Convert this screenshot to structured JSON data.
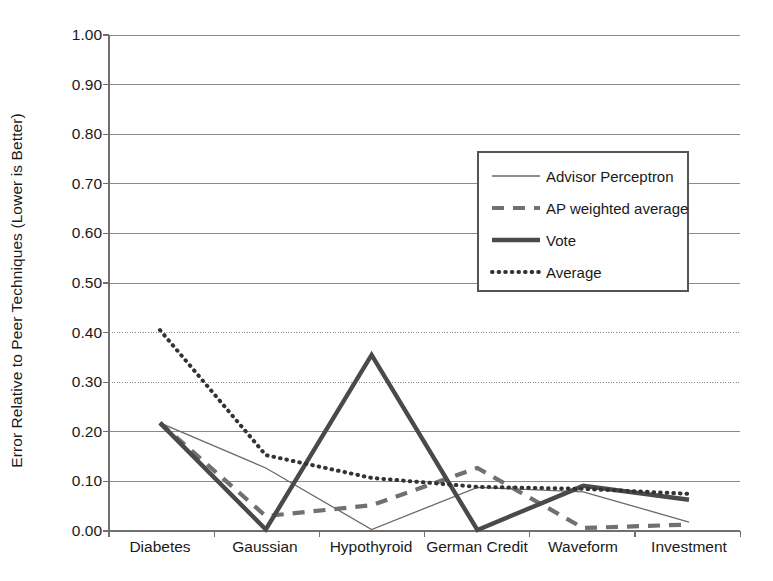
{
  "chart_data": {
    "type": "line",
    "title": "",
    "xlabel": "",
    "ylabel": "Error Relative to Peer Techniques (Lower is Better)",
    "categories": [
      "Diabetes",
      "Gaussian",
      "Hypothyroid",
      "German Credit",
      "Waveform",
      "Investment"
    ],
    "ylim": [
      0.0,
      1.0
    ],
    "ytick_labels": [
      "0.00",
      "0.10",
      "0.20",
      "0.30",
      "0.40",
      "0.50",
      "0.60",
      "0.70",
      "0.80",
      "0.90",
      "1.00"
    ],
    "ytick_values": [
      0.0,
      0.1,
      0.2,
      0.3,
      0.4,
      0.5,
      0.6,
      0.7,
      0.8,
      0.9,
      1.0
    ],
    "grid": true,
    "legend_position": "upper right",
    "series": [
      {
        "name": "Advisor Perceptron",
        "style": "thin-solid",
        "values": [
          0.218,
          0.127,
          0.003,
          0.088,
          0.079,
          0.018
        ]
      },
      {
        "name": "AP weighted average",
        "style": "thick-dashed",
        "values": [
          0.218,
          0.03,
          0.052,
          0.127,
          0.006,
          0.013
        ]
      },
      {
        "name": "Vote",
        "style": "thick-solid",
        "values": [
          0.218,
          0.003,
          0.355,
          0.002,
          0.091,
          0.063
        ]
      },
      {
        "name": "Average",
        "style": "dotted",
        "values": [
          0.405,
          0.153,
          0.107,
          0.089,
          0.085,
          0.075
        ]
      }
    ]
  },
  "legend": {
    "items": [
      {
        "label": "Advisor Perceptron"
      },
      {
        "label": "AP weighted average"
      },
      {
        "label": "Vote"
      },
      {
        "label": "Average"
      }
    ]
  },
  "colors": {
    "axis": "#6f6f6f",
    "grid": "#8a8a8a",
    "series_thin": "#6a6a6a",
    "series_dashed": "#707070",
    "series_thick": "#4a4a4a",
    "series_dotted": "#333333",
    "text": "#1a1a1a",
    "background": "#ffffff"
  }
}
